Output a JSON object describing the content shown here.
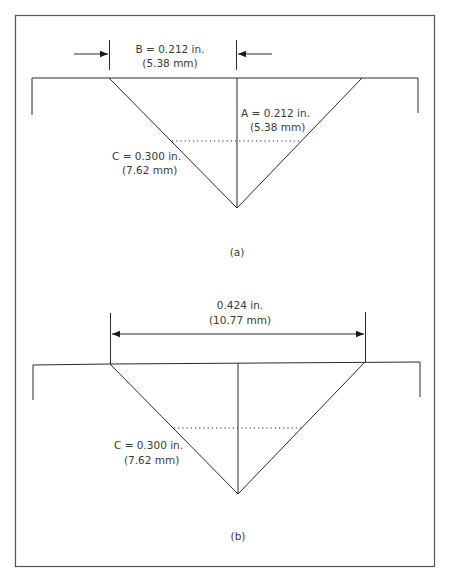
{
  "figure": {
    "panel_a": {
      "caption": "(a)",
      "dimension_b": {
        "line1": "B = 0.212 in.",
        "line2": "(5.38 mm)"
      },
      "dimension_a": {
        "line1": "A = 0.212 in.",
        "line2": "(5.38 mm)"
      },
      "dimension_c": {
        "line1": "C = 0.300 in.",
        "line2": "(7.62 mm)"
      }
    },
    "panel_b": {
      "caption": "(b)",
      "dimension_width": {
        "line1": "0.424 in.",
        "line2": "(10.77 mm)"
      },
      "dimension_c": {
        "line1": "C = 0.300 in.",
        "line2": "(7.62 mm)"
      }
    },
    "colors": {
      "line": "#2a2a2a",
      "text": "#3a3a3a",
      "frame": "#555555"
    }
  }
}
